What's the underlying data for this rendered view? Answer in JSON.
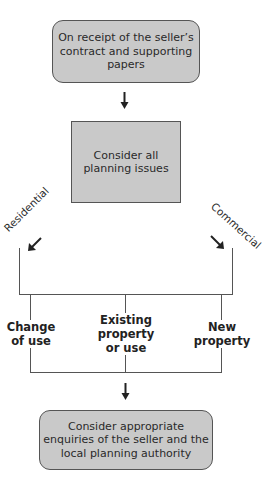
{
  "diagram": {
    "start_box": {
      "text": "On receipt of the seller’s\ncontract and supporting\npapers"
    },
    "middle_box": {
      "text": "Consider all\nplanning issues"
    },
    "branches": {
      "left": "Residential",
      "right": "Commercial"
    },
    "options": [
      {
        "text": "Change\nof use"
      },
      {
        "text": "Existing\nproperty\nor use"
      },
      {
        "text": "New\nproperty"
      }
    ],
    "end_box": {
      "text": "Consider appropriate\nenquiries of the seller and the\nlocal planning authority"
    },
    "colors": {
      "box_fill": "#c9c9c9",
      "line": "#555555"
    }
  }
}
